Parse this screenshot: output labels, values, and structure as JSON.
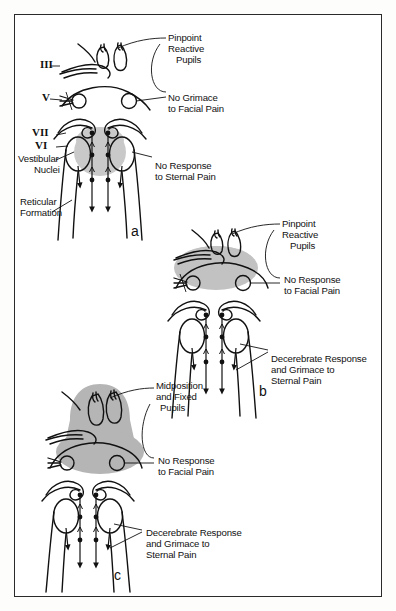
{
  "figure": {
    "domain": "medical-illustration",
    "border_color": "#2a2a2a",
    "background_color": "#ffffff",
    "ink_color": "#111111",
    "shade_color_light": "#c9c9c9",
    "shade_color_mid": "#b8b8b8",
    "shade_color_dark": "#a8a8a8"
  },
  "panels": [
    {
      "id": "a",
      "letter": "a",
      "stage": "diencephalic",
      "labels": {
        "nerve_3": "III",
        "nerve_5": "V",
        "nerve_7": "VII",
        "nerve_6": "VI",
        "vestibular_nuclei_line1": "Vestibular",
        "vestibular_nuclei_line2": "Nuclei",
        "reticular_formation_line1": "Reticular",
        "reticular_formation_line2": "Formation",
        "pupils_line1": "Pinpoint",
        "pupils_line2": "Reactive",
        "pupils_line3": "Pupils",
        "facial_line1": "No Grimace",
        "facial_line2": "to Facial Pain",
        "sternal_line1": "No Response",
        "sternal_line2": "to Sternal Pain"
      }
    },
    {
      "id": "b",
      "letter": "b",
      "stage": "upper-pontine",
      "labels": {
        "pupils_line1": "Pinpoint",
        "pupils_line2": "Reactive",
        "pupils_line3": "Pupils",
        "facial_line1": "No Response",
        "facial_line2": "to Facial Pain",
        "sternal_line1": "Decerebrate Response",
        "sternal_line2": "and Grimace to",
        "sternal_line3": "Sternal Pain"
      }
    },
    {
      "id": "c",
      "letter": "c",
      "stage": "lower-pontine",
      "labels": {
        "pupils_line1": "Midposition",
        "pupils_line2": "and Fixed",
        "pupils_line3": "Pupils",
        "facial_line1": "No Response",
        "facial_line2": "to Facial Pain",
        "sternal_line1": "Decerebrate Response",
        "sternal_line2": "and Grimace to",
        "sternal_line3": "Sternal Pain"
      }
    }
  ]
}
